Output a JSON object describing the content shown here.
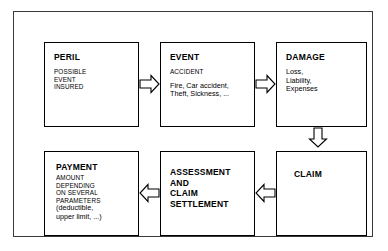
{
  "diagram": {
    "type": "flowchart",
    "nodes": [
      {
        "id": "peril",
        "title": "PERIL",
        "lines": [
          "POSSIBLE",
          "EVENT",
          "INSURED"
        ]
      },
      {
        "id": "event",
        "title": "EVENT",
        "subtitle": "ACCIDENT",
        "lines": [
          "Fire, Car accident,",
          "Theft, Sickness, ..."
        ]
      },
      {
        "id": "damage",
        "title": "DAMAGE",
        "lines": [
          "Loss,",
          "Liability,",
          "Expenses"
        ]
      },
      {
        "id": "payment",
        "title": "PAYMENT",
        "caps_lines": [
          "AMOUNT",
          "DEPENDING",
          "ON SEVERAL",
          "PARAMETERS"
        ],
        "lines": [
          "(deductible,",
          "upper limit, ...)"
        ]
      },
      {
        "id": "assessment",
        "title_lines": [
          "ASSESSMENT",
          "AND",
          "CLAIM",
          "SETTLEMENT"
        ]
      },
      {
        "id": "claim",
        "title": "CLAIM"
      }
    ],
    "arrows": [
      {
        "id": "peril-event",
        "direction": "right",
        "from": "PERIL",
        "to": "EVENT"
      },
      {
        "id": "event-damage",
        "direction": "right",
        "from": "EVENT",
        "to": "DAMAGE"
      },
      {
        "id": "damage-claim",
        "direction": "down",
        "from": "DAMAGE",
        "to": "CLAIM"
      },
      {
        "id": "claim-assessment",
        "direction": "left",
        "from": "CLAIM",
        "to": "ASSESSMENT AND CLAIM SETTLEMENT"
      },
      {
        "id": "assessment-payment",
        "direction": "left",
        "from": "ASSESSMENT AND CLAIM SETTLEMENT",
        "to": "PAYMENT"
      }
    ],
    "colors": {
      "stroke": "#000000",
      "frame": "#3a3a3a",
      "background": "#ffffff"
    }
  }
}
